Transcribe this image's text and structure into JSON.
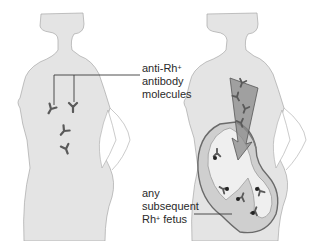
{
  "figure": {
    "panels": [
      {
        "id": "left",
        "subject": "Rh- mother with anti-Rh+ antibody molecules in bloodstream"
      },
      {
        "id": "right",
        "subject": "pregnant mother; antibodies crossing into fetus"
      }
    ]
  },
  "labels": {
    "antibody": {
      "line1_prefix": "anti-Rh",
      "line1_sup": "+",
      "line2": "antibody",
      "line3": "molecules"
    },
    "fetus": {
      "line1": "any",
      "line2": "subsequent",
      "line3_prefix": "Rh",
      "line3_sup": "+",
      "line3_suffix": " fetus"
    }
  },
  "colors": {
    "body_fill": "#e4e4e4",
    "body_outline": "#a8a8a8",
    "antibody": "#5a5a5a",
    "leader_line": "#3a3a3a",
    "arrow_fill": "#8a8a8a",
    "uterus_fill": "#cfcfcf",
    "fetus_fill": "#efefef",
    "label_text": "#2a2a2a"
  }
}
